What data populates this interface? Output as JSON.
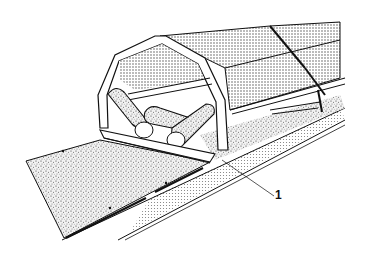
{
  "figure": {
    "callouts": [
      {
        "id": "1",
        "label": "1",
        "target": "idler frame base / support rail"
      }
    ],
    "colors": {
      "ink": "#111111",
      "background": "#ffffff",
      "stipple_dark": "#555555",
      "stipple_light": "#9a9a9a"
    }
  }
}
